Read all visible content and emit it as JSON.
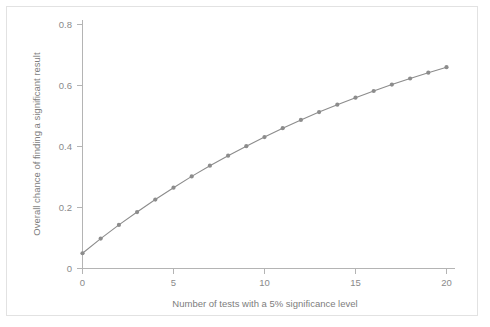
{
  "chart_data": {
    "type": "line",
    "title": "",
    "subtitle": "",
    "xlabel": "Number of tests with a 5% significance level",
    "ylabel": "Overall chance of finding a significant result",
    "x": [
      0,
      1,
      2,
      3,
      4,
      5,
      6,
      7,
      8,
      9,
      10,
      11,
      12,
      13,
      14,
      15,
      16,
      17,
      18,
      19,
      20
    ],
    "values": [
      0.05,
      0.098,
      0.143,
      0.185,
      0.226,
      0.265,
      0.302,
      0.337,
      0.37,
      0.401,
      0.431,
      0.46,
      0.487,
      0.513,
      0.537,
      0.56,
      0.582,
      0.603,
      0.623,
      0.642,
      0.66
    ],
    "series": [
      {
        "name": "Overall chance of finding a significant result",
        "values": [
          0.05,
          0.098,
          0.143,
          0.185,
          0.226,
          0.265,
          0.302,
          0.337,
          0.37,
          0.401,
          0.431,
          0.46,
          0.487,
          0.513,
          0.537,
          0.56,
          0.582,
          0.603,
          0.623,
          0.642,
          0.66
        ]
      }
    ],
    "xlim": [
      -0.35,
      20.9
    ],
    "ylim": [
      -0.012,
      0.812
    ],
    "xticks": [
      0,
      5,
      10,
      15,
      20
    ],
    "xticklabels": [
      "0",
      "5",
      "10",
      "15",
      "20"
    ],
    "yticks": [
      0,
      0.2,
      0.4,
      0.6,
      0.8
    ],
    "yticklabels": [
      "0",
      "0.2",
      "0.4",
      "0.6",
      "0.8"
    ],
    "grid": false,
    "legend": false,
    "legend_position": "none",
    "marker": "circle",
    "marker_size": 4.2,
    "line_color": "#8c8c8c",
    "marker_color": "#8c8c8c",
    "axis_color": "#b4b4b4",
    "tick_label_color": "#8a8a8a",
    "axis_title_color": "#7d7d7d",
    "background_color": "#ffffff",
    "border_color": "#e2e2e2"
  },
  "axes": {
    "x_title": "Number of tests with a 5% significance level",
    "y_title": "Overall chance of finding a significant result",
    "x_tick_labels": [
      "0",
      "5",
      "10",
      "15",
      "20"
    ],
    "y_tick_labels": [
      "0",
      "0.2",
      "0.4",
      "0.6",
      "0.8"
    ]
  }
}
